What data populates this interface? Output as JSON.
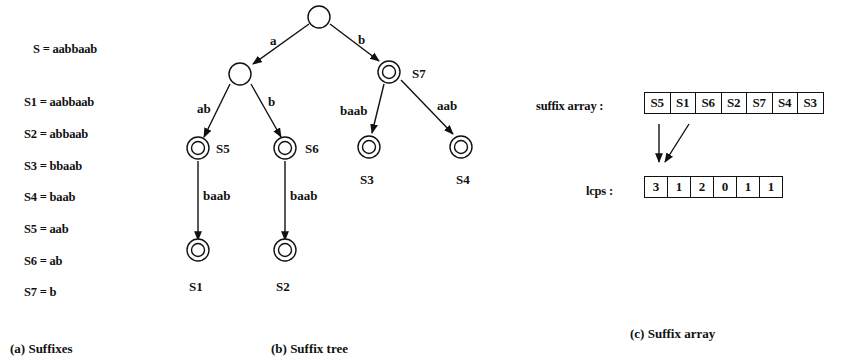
{
  "panel_a": {
    "string_def": "S = aabbaab",
    "suffixes": [
      "S1 = aabbaab",
      "S2 = abbaab",
      "S3 = bbaab",
      "S4 = baab",
      "S5 = aab",
      "S6 = ab",
      "S7 = b"
    ],
    "caption": "(a) Suffixes"
  },
  "panel_b": {
    "caption": "(b) Suffix tree",
    "edges": {
      "root_a": "a",
      "root_b": "b",
      "a_ab": "ab",
      "a_b": "b",
      "s5_s1": "baab",
      "s6_s2": "baab",
      "s7_s3": "baab",
      "s7_s4": "aab"
    },
    "nodes": {
      "s5": "S5",
      "s6": "S6",
      "s7": "S7",
      "s1": "S1",
      "s2": "S2",
      "s3": "S3",
      "s4": "S4"
    }
  },
  "panel_c": {
    "suffix_array_label": "suffix array :",
    "suffix_array": [
      "S5",
      "S1",
      "S6",
      "S2",
      "S7",
      "S4",
      "S3"
    ],
    "lcps_label": "lcps :",
    "lcps": [
      "3",
      "1",
      "2",
      "0",
      "1",
      "1"
    ],
    "caption": "(c) Suffix array"
  }
}
